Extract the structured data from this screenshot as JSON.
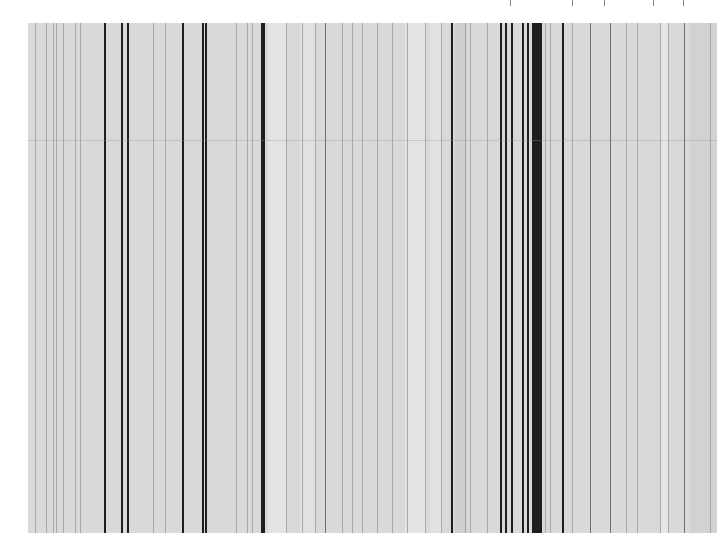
{
  "figure": {
    "caption_text_visible": false,
    "caption_note": "Text at top edge is cropped; only descender fragments are visible and unreadable",
    "plate": {
      "x": 28,
      "y": 23,
      "width": 689,
      "height": 510,
      "background": "#d9d9d9"
    },
    "seam_y_offset": 117
  },
  "chart_data": {
    "type": "spectral_lines",
    "title": "",
    "xlabel": "",
    "ylabel": "",
    "axes_visible": false,
    "x_units": "pixels (screenshot coordinates)",
    "note": "No wavelength scale, tick labels, or element labels are visible; positions are measured pixel x-coordinates, intensities are approximate visual classes. Line identities cannot be determined from the image.",
    "lines": [
      {
        "x": 35,
        "intensity": "faint"
      },
      {
        "x": 46,
        "intensity": "faint"
      },
      {
        "x": 53,
        "intensity": "faint"
      },
      {
        "x": 56,
        "intensity": "faint"
      },
      {
        "x": 63,
        "intensity": "faint"
      },
      {
        "x": 75,
        "intensity": "faint"
      },
      {
        "x": 80,
        "intensity": "faint"
      },
      {
        "x": 104,
        "intensity": "strong"
      },
      {
        "x": 121,
        "intensity": "strong"
      },
      {
        "x": 127,
        "intensity": "strong"
      },
      {
        "x": 153,
        "intensity": "faint"
      },
      {
        "x": 165,
        "intensity": "faint"
      },
      {
        "x": 182,
        "intensity": "strong"
      },
      {
        "x": 202,
        "intensity": "strong"
      },
      {
        "x": 205,
        "intensity": "strong"
      },
      {
        "x": 236,
        "intensity": "faint"
      },
      {
        "x": 247,
        "intensity": "faint"
      },
      {
        "x": 252,
        "intensity": "faint"
      },
      {
        "x": 261,
        "intensity": "strong"
      },
      {
        "x": 263,
        "intensity": "strong"
      },
      {
        "x": 286,
        "intensity": "faint"
      },
      {
        "x": 302,
        "intensity": "faint"
      },
      {
        "x": 315,
        "intensity": "faint"
      },
      {
        "x": 325,
        "intensity": "medium"
      },
      {
        "x": 342,
        "intensity": "faint"
      },
      {
        "x": 352,
        "intensity": "faint"
      },
      {
        "x": 362,
        "intensity": "faint"
      },
      {
        "x": 377,
        "intensity": "faint"
      },
      {
        "x": 392,
        "intensity": "faint"
      },
      {
        "x": 407,
        "intensity": "faint"
      },
      {
        "x": 425,
        "intensity": "faint"
      },
      {
        "x": 441,
        "intensity": "faint"
      },
      {
        "x": 451,
        "intensity": "strong"
      },
      {
        "x": 465,
        "intensity": "faint"
      },
      {
        "x": 470,
        "intensity": "faint"
      },
      {
        "x": 487,
        "intensity": "faint"
      },
      {
        "x": 500,
        "intensity": "strong"
      },
      {
        "x": 505,
        "intensity": "strong"
      },
      {
        "x": 511,
        "intensity": "strong"
      },
      {
        "x": 522,
        "intensity": "strong"
      },
      {
        "x": 527,
        "intensity": "strong"
      },
      {
        "x": 532,
        "intensity": "strong"
      },
      {
        "x": 534,
        "intensity": "strong"
      },
      {
        "x": 536,
        "intensity": "strong"
      },
      {
        "x": 538,
        "intensity": "strong"
      },
      {
        "x": 540,
        "intensity": "strong"
      },
      {
        "x": 545,
        "intensity": "faint"
      },
      {
        "x": 550,
        "intensity": "faint"
      },
      {
        "x": 562,
        "intensity": "strong"
      },
      {
        "x": 572,
        "intensity": "faint"
      },
      {
        "x": 590,
        "intensity": "medium"
      },
      {
        "x": 610,
        "intensity": "medium"
      },
      {
        "x": 626,
        "intensity": "faint"
      },
      {
        "x": 637,
        "intensity": "faint"
      },
      {
        "x": 660,
        "intensity": "faint"
      },
      {
        "x": 668,
        "intensity": "faint"
      },
      {
        "x": 684,
        "intensity": "medium"
      },
      {
        "x": 710,
        "intensity": "faint"
      }
    ],
    "light_bands": [
      {
        "x": 268,
        "width": 18,
        "color": "#e3e3e3"
      },
      {
        "x": 300,
        "width": 15,
        "color": "#e1e1e1"
      },
      {
        "x": 405,
        "width": 20,
        "color": "#e4e4e4"
      },
      {
        "x": 430,
        "width": 12,
        "color": "#e2e2e2"
      },
      {
        "x": 660,
        "width": 8,
        "color": "#e6e6e6"
      }
    ],
    "dark_bands": [
      {
        "x": 455,
        "width": 12,
        "color": "#cfcfcf"
      },
      {
        "x": 690,
        "width": 27,
        "color": "#d2d2d2"
      }
    ],
    "intensity_styles": {
      "strong": {
        "color": "#1e1e1e",
        "width": 1.6
      },
      "medium": {
        "color": "#6e6e6e",
        "width": 1.2
      },
      "faint": {
        "color": "#a8a8a8",
        "width": 1
      }
    }
  },
  "caption_fragments_x": [
    510,
    572,
    604,
    653,
    683
  ]
}
